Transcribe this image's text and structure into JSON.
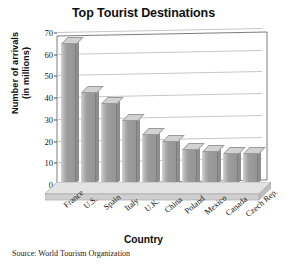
{
  "chart_data": {
    "type": "bar",
    "title": "Top Tourist Destinations",
    "xlabel": "Country",
    "ylabel": "Number of arrivals (in millions)",
    "ylabel_line1": "Number of arrivals",
    "ylabel_line2": "(in millions)",
    "categories": [
      "France",
      "U.S.",
      "Spain",
      "Italy",
      "U.K.",
      "China",
      "Poland",
      "Mexico",
      "Canada",
      "Czech Rep."
    ],
    "values": [
      66,
      43,
      38,
      30,
      23,
      20,
      16,
      15,
      14,
      14
    ],
    "yticks": [
      0,
      10,
      20,
      30,
      40,
      50,
      60,
      70
    ],
    "ylim": [
      0,
      70
    ],
    "grid": true,
    "legend": "none",
    "style": "3d-column",
    "bar_color": "#a0a0a0",
    "source_note": "Source: World Tourism Organization"
  }
}
